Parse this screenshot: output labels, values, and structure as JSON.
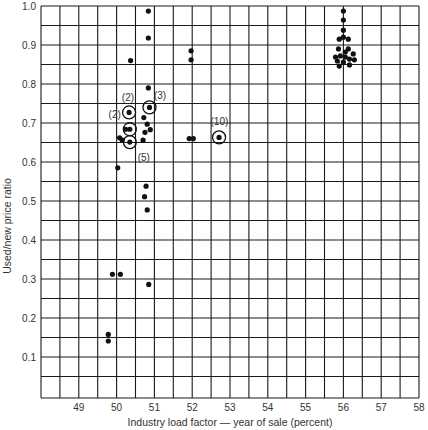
{
  "chart_data": {
    "type": "scatter",
    "title": "",
    "xlabel": "Industry load factor — year of sale (percent)",
    "ylabel": "Used/new price ratio",
    "xlim": [
      48,
      58
    ],
    "ylim": [
      0,
      1.0
    ],
    "grid": true,
    "grid_step_x": 0.5,
    "grid_step_y": 0.05,
    "x_ticks": [
      49,
      50,
      51,
      52,
      53,
      54,
      55,
      56,
      57,
      58
    ],
    "x_tick_labels": [
      "49",
      "50",
      "51",
      "52",
      "53",
      "54",
      "55",
      "56",
      "57",
      "58"
    ],
    "y_ticks": [
      0.1,
      0.2,
      0.3,
      0.4,
      0.5,
      0.6,
      0.7,
      0.8,
      0.9,
      1.0
    ],
    "y_tick_labels": [
      "0.1",
      "0.2",
      "0.3",
      "0.4",
      "0.5",
      "0.6",
      "0.7",
      "0.8",
      "0.9",
      "1.0"
    ],
    "legend": null,
    "series": [
      {
        "name": "observations",
        "points": [
          {
            "x": 50.84,
            "y": 0.987
          },
          {
            "x": 50.84,
            "y": 0.918
          },
          {
            "x": 50.37,
            "y": 0.86
          },
          {
            "x": 51.97,
            "y": 0.885
          },
          {
            "x": 51.97,
            "y": 0.862
          },
          {
            "x": 50.84,
            "y": 0.79
          },
          {
            "x": 50.33,
            "y": 0.727,
            "circled": true,
            "count_label": "(2)",
            "label_pos": "left"
          },
          {
            "x": 50.87,
            "y": 0.74,
            "circled": true,
            "count_label": "(3)",
            "label_pos": "right"
          },
          {
            "x": 50.72,
            "y": 0.714
          },
          {
            "x": 50.81,
            "y": 0.697
          },
          {
            "x": 50.35,
            "y": 0.684,
            "circled": true,
            "count_label": "(2)",
            "label_pos": "top-far"
          },
          {
            "x": 50.24,
            "y": 0.684
          },
          {
            "x": 50.89,
            "y": 0.683
          },
          {
            "x": 50.75,
            "y": 0.676
          },
          {
            "x": 50.08,
            "y": 0.662
          },
          {
            "x": 50.15,
            "y": 0.656
          },
          {
            "x": 50.35,
            "y": 0.651,
            "circled": true,
            "count_label": "(5)",
            "label_pos": "below-right"
          },
          {
            "x": 50.7,
            "y": 0.656
          },
          {
            "x": 51.92,
            "y": 0.66
          },
          {
            "x": 52.03,
            "y": 0.66
          },
          {
            "x": 52.71,
            "y": 0.663,
            "circled": true,
            "count_label": "(10)",
            "label_pos": "top"
          },
          {
            "x": 50.03,
            "y": 0.585
          },
          {
            "x": 50.78,
            "y": 0.538
          },
          {
            "x": 50.74,
            "y": 0.511
          },
          {
            "x": 50.81,
            "y": 0.477
          },
          {
            "x": 49.89,
            "y": 0.312
          },
          {
            "x": 50.1,
            "y": 0.312
          },
          {
            "x": 50.85,
            "y": 0.286
          },
          {
            "x": 49.78,
            "y": 0.158
          },
          {
            "x": 49.78,
            "y": 0.141
          },
          {
            "x": 56.0,
            "y": 0.987
          },
          {
            "x": 56.0,
            "y": 0.964
          },
          {
            "x": 56.0,
            "y": 0.938
          },
          {
            "x": 56.0,
            "y": 0.92
          },
          {
            "x": 55.89,
            "y": 0.915
          },
          {
            "x": 56.13,
            "y": 0.915
          },
          {
            "x": 55.87,
            "y": 0.89
          },
          {
            "x": 56.13,
            "y": 0.89
          },
          {
            "x": 56.05,
            "y": 0.882
          },
          {
            "x": 55.79,
            "y": 0.869
          },
          {
            "x": 55.92,
            "y": 0.872
          },
          {
            "x": 56.05,
            "y": 0.869
          },
          {
            "x": 56.26,
            "y": 0.877
          },
          {
            "x": 55.84,
            "y": 0.859
          },
          {
            "x": 56.0,
            "y": 0.856
          },
          {
            "x": 56.16,
            "y": 0.864
          },
          {
            "x": 56.29,
            "y": 0.862
          },
          {
            "x": 55.89,
            "y": 0.846
          },
          {
            "x": 56.16,
            "y": 0.849
          }
        ]
      }
    ],
    "annotations": [
      {
        "text": "(2)",
        "x": 50.3,
        "y": 0.766
      },
      {
        "text": "(2)",
        "x": 49.95,
        "y": 0.722
      },
      {
        "text": "(3)",
        "x": 51.15,
        "y": 0.771
      },
      {
        "text": "(5)",
        "x": 50.72,
        "y": 0.612
      },
      {
        "text": "(10)",
        "x": 52.72,
        "y": 0.705
      }
    ]
  },
  "layout": {
    "plot_left_px": 41,
    "plot_right_px": 419,
    "plot_top_px": 6,
    "plot_bottom_px": 398,
    "y_zero_px": 396
  }
}
